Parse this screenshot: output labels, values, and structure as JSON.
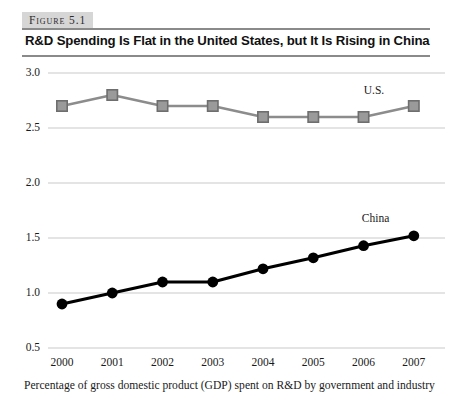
{
  "figure": {
    "label": "Figure 5.1",
    "title": "R&D Spending Is Flat in the United States, but It Is Rising in China",
    "caption": "Percentage of gross domestic product (GDP) spent on R&D by government and industry"
  },
  "colors": {
    "us_line": "#8c8c8c",
    "us_marker_fill": "#9a9a9a",
    "us_marker_stroke": "#6e6e6e",
    "china_line": "#000000",
    "china_marker": "#000000",
    "gridline": "#c9c9c9",
    "label_band": "#d6d6d6",
    "rule": "#8a8a8a"
  },
  "chart_data": {
    "type": "line",
    "title": "R&D Spending Is Flat in the United States, but It Is Rising in China",
    "xlabel": "",
    "ylabel": "",
    "ylim": [
      0.5,
      3.0
    ],
    "yticks": [
      "0.5",
      "1.0",
      "1.5",
      "2.0",
      "2.5",
      "3.0"
    ],
    "ytick_values": [
      0.5,
      1.0,
      1.5,
      2.0,
      2.5,
      3.0
    ],
    "grid": true,
    "legend_position": "inline-right",
    "categories": [
      "2000",
      "2001",
      "2002",
      "2003",
      "2004",
      "2005",
      "2006",
      "2007"
    ],
    "series": [
      {
        "name": "U.S.",
        "marker": "square",
        "values": [
          2.7,
          2.8,
          2.7,
          2.7,
          2.6,
          2.6,
          2.6,
          2.7
        ]
      },
      {
        "name": "China",
        "marker": "circle",
        "values": [
          0.9,
          1.0,
          1.1,
          1.1,
          1.22,
          1.32,
          1.43,
          1.52
        ]
      }
    ]
  }
}
